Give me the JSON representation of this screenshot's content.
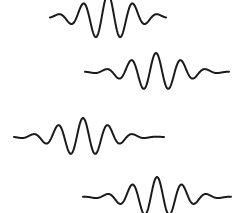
{
  "figure": {
    "background_color": "#ffffff",
    "stroke_color": "#1a1a1a",
    "stroke_width": 2,
    "width": 232,
    "height": 213
  },
  "chart_data": {
    "type": "line",
    "subtitle": "",
    "xlabel": "",
    "ylabel": "",
    "grid": false,
    "legend_position": "none",
    "axes_visible": false,
    "xlim": [
      0,
      232
    ],
    "ylim": [
      0,
      213
    ],
    "series": [
      {
        "name": "wave-packet-1",
        "label": "Top wave packet (clipped at top edge)",
        "x_start": 50,
        "x_end": 166,
        "baseline_y": 17,
        "peak_y": -6,
        "trough_y": 32,
        "amplitude": 23,
        "wavelength": 25,
        "phase": 0,
        "envelope_center": 108,
        "envelope_width": 34,
        "clipped": "top"
      },
      {
        "name": "wave-packet-2",
        "label": "Second wave packet",
        "x_start": 85,
        "x_end": 229,
        "baseline_y": 72,
        "peak_y": 54,
        "trough_y": 90,
        "amplitude": 19,
        "wavelength": 25,
        "phase": 0,
        "envelope_center": 156,
        "envelope_width": 36,
        "clipped": "none"
      },
      {
        "name": "wave-packet-3",
        "label": "Third wave packet",
        "x_start": 14,
        "x_end": 164,
        "baseline_y": 137,
        "peak_y": 119,
        "trough_y": 156,
        "amplitude": 19,
        "wavelength": 25,
        "phase": 0,
        "envelope_center": 83,
        "envelope_width": 36,
        "clipped": "none"
      },
      {
        "name": "wave-packet-4",
        "label": "Bottom wave packet (clipped at bottom edge)",
        "x_start": 83,
        "x_end": 231,
        "baseline_y": 197,
        "peak_y": 178,
        "trough_y": 216,
        "amplitude": 20,
        "wavelength": 25,
        "phase": 0,
        "envelope_center": 157,
        "envelope_width": 36,
        "clipped": "bottom"
      }
    ]
  }
}
